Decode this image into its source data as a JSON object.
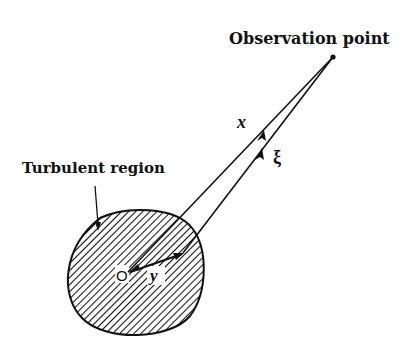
{
  "diagram": {
    "labels": {
      "observation_point": "Observation point",
      "turbulent_region": "Turbulent region",
      "vector_x": "x",
      "vector_xi": "ξ",
      "origin": "O",
      "vector_y": "y"
    },
    "colors": {
      "ink": "#111111",
      "background": "#ffffff"
    },
    "elements": [
      "observation-point-dot",
      "turbulent-region-blob (hatched)",
      "vector x from O to observation point",
      "vector ξ from source point to observation point",
      "vector y from O to source point",
      "pointer from turbulent region label to blob"
    ]
  }
}
